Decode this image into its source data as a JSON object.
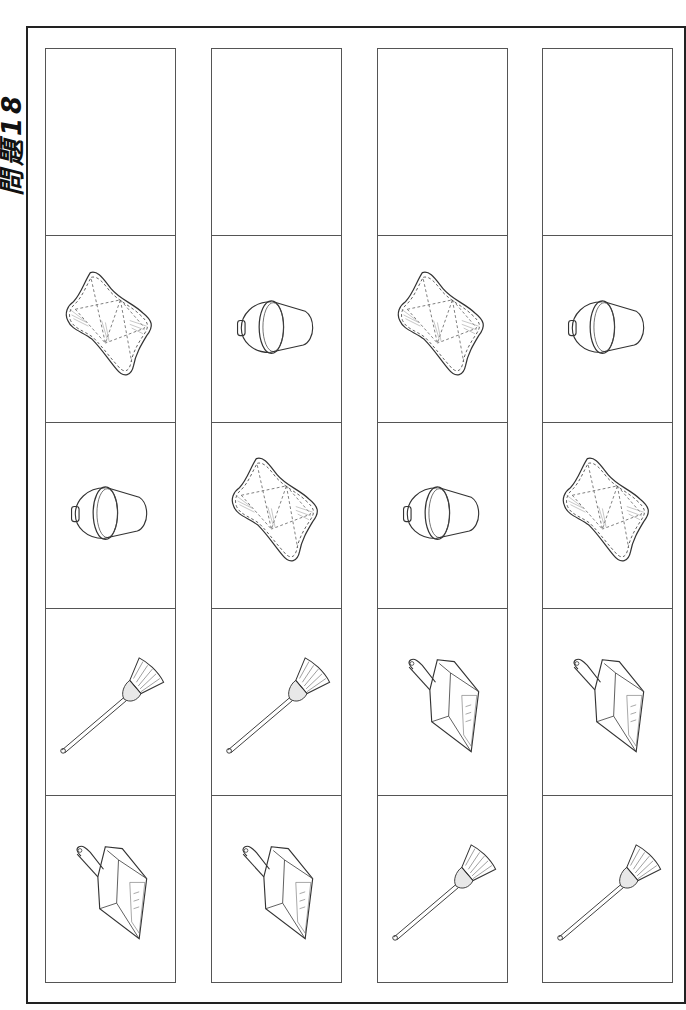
{
  "title": "問題18",
  "colors": {
    "line": "#555555",
    "frame": "#222222",
    "background": "#ffffff"
  },
  "columns": [
    {
      "index": 1,
      "cells": [
        "blank",
        "cloth",
        "bucket",
        "broom",
        "dustpan"
      ]
    },
    {
      "index": 2,
      "cells": [
        "blank",
        "bucket",
        "cloth",
        "broom",
        "dustpan"
      ]
    },
    {
      "index": 3,
      "cells": [
        "blank",
        "cloth",
        "bucket",
        "dustpan",
        "broom"
      ]
    },
    {
      "index": 4,
      "cells": [
        "blank",
        "bucket",
        "cloth",
        "dustpan",
        "broom"
      ]
    }
  ],
  "icons": {
    "blank": "empty-answer-box",
    "cloth": "cleaning-cloth-icon",
    "bucket": "bucket-icon",
    "broom": "broom-icon",
    "dustpan": "dustpan-icon"
  }
}
